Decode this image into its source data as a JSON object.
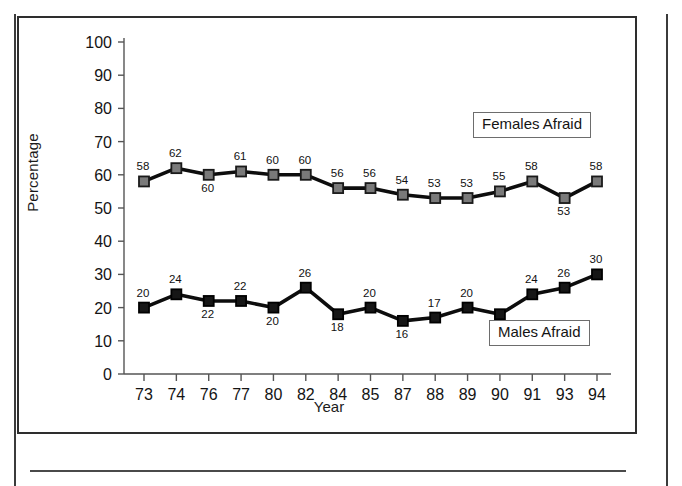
{
  "chart_data": {
    "type": "line",
    "title": "",
    "xlabel": "Year",
    "ylabel": "Percentage",
    "ylim": [
      0,
      100
    ],
    "ytick_step": 10,
    "yticks": [
      0,
      10,
      20,
      30,
      40,
      50,
      60,
      70,
      80,
      90,
      100
    ],
    "grid": false,
    "legend_position": "inside-right",
    "categories": [
      "73",
      "74",
      "76",
      "77",
      "80",
      "82",
      "84",
      "85",
      "87",
      "88",
      "89",
      "90",
      "91",
      "93",
      "94"
    ],
    "series": [
      {
        "name": "Females Afraid",
        "values": [
          58,
          62,
          60,
          61,
          60,
          60,
          56,
          56,
          54,
          53,
          53,
          55,
          58,
          53,
          58
        ],
        "marker": "square",
        "marker_fill": "#7a7a7a",
        "marker_stroke": "#1a1a1a",
        "line_color": "#0d0d0d",
        "show_labels": true
      },
      {
        "name": "Males Afraid",
        "values": [
          20,
          24,
          22,
          22,
          20,
          26,
          18,
          20,
          16,
          17,
          20,
          18,
          24,
          26,
          30
        ],
        "marker": "square",
        "marker_fill": "#161616",
        "marker_stroke": "#000000",
        "line_color": "#0d0d0d",
        "show_labels": true
      }
    ]
  },
  "legend": {
    "females_label": "Females Afraid",
    "males_label": "Males Afraid"
  },
  "axes": {
    "y_title": "Percentage",
    "x_title": "Year"
  },
  "colors": {
    "frame": "#2e2e2e",
    "axis": "#555555",
    "line": "#0d0d0d",
    "female_marker": "#7a7a7a",
    "male_marker": "#161616",
    "text": "#141414",
    "page_rule": "#3b3b3b"
  }
}
